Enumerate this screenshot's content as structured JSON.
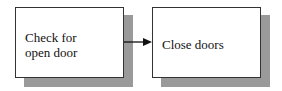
{
  "diagram": {
    "type": "flowchart",
    "nodes": [
      {
        "id": "check",
        "label": "Check for\nopen door"
      },
      {
        "id": "close",
        "label": "Close doors"
      }
    ],
    "edges": [
      {
        "from": "check",
        "to": "close",
        "style": "arrow"
      }
    ],
    "colors": {
      "shadow": "#9a9a9a",
      "border": "#333333",
      "fill": "#ffffff"
    }
  }
}
